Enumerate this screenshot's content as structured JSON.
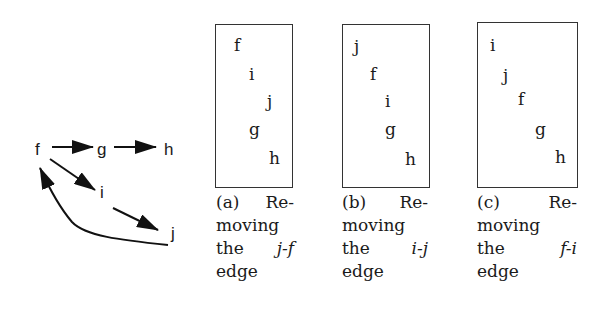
{
  "graph": {
    "nodes": [
      {
        "id": "f",
        "label": "f",
        "x": 35,
        "y": 141
      },
      {
        "id": "g",
        "label": "g",
        "x": 97,
        "y": 141
      },
      {
        "id": "h",
        "label": "h",
        "x": 164,
        "y": 141
      },
      {
        "id": "i",
        "label": "i",
        "x": 100,
        "y": 184
      },
      {
        "id": "j",
        "label": "j",
        "x": 171,
        "y": 225
      }
    ],
    "edges": [
      {
        "from": "f",
        "to": "g"
      },
      {
        "from": "g",
        "to": "h"
      },
      {
        "from": "f",
        "to": "i"
      },
      {
        "from": "i",
        "to": "j"
      },
      {
        "from": "j",
        "to": "f",
        "curved": true
      }
    ]
  },
  "panels": [
    {
      "id": "a",
      "order": [
        {
          "label": "f",
          "x": 20,
          "y": 12
        },
        {
          "label": "i",
          "x": 35,
          "y": 41
        },
        {
          "label": "j",
          "x": 53,
          "y": 68
        },
        {
          "label": "g",
          "x": 35,
          "y": 96
        },
        {
          "label": "h",
          "x": 55,
          "y": 125
        }
      ],
      "caption": {
        "line1_left": "(a)",
        "line1_right": "Re-",
        "line2": "moving",
        "line3_left": "the",
        "line3_right": "j-f",
        "line4": "edge"
      }
    },
    {
      "id": "b",
      "order": [
        {
          "label": "j",
          "x": 11,
          "y": 13
        },
        {
          "label": "f",
          "x": 27,
          "y": 41
        },
        {
          "label": "i",
          "x": 42,
          "y": 68
        },
        {
          "label": "g",
          "x": 42,
          "y": 96
        },
        {
          "label": "h",
          "x": 62,
          "y": 126
        }
      ],
      "caption": {
        "line1_left": "(b)",
        "line1_right": "Re-",
        "line2": "moving",
        "line3_left": "the",
        "line3_right": "i-j",
        "line4": "edge"
      }
    },
    {
      "id": "c",
      "order": [
        {
          "label": "i",
          "x": 13,
          "y": 14
        },
        {
          "label": "j",
          "x": 26,
          "y": 44
        },
        {
          "label": "f",
          "x": 41,
          "y": 68
        },
        {
          "label": "g",
          "x": 58,
          "y": 98
        },
        {
          "label": "h",
          "x": 78,
          "y": 126
        }
      ],
      "caption": {
        "line1_left": "(c)",
        "line1_right": "Re-",
        "line2": "moving",
        "line3_left": "the",
        "line3_right": "f-i",
        "line4": "edge"
      }
    }
  ]
}
